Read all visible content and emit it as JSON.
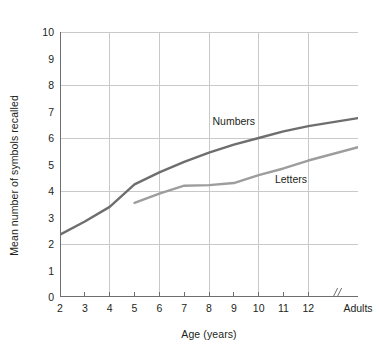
{
  "chart_data": {
    "type": "line",
    "title": "",
    "xlabel": "Age (years)",
    "ylabel": "Mean number of symbols recalled",
    "xlim": [
      2,
      14
    ],
    "ylim": [
      0,
      10
    ],
    "x_tick_labels": [
      "2",
      "3",
      "4",
      "5",
      "6",
      "7",
      "8",
      "9",
      "10",
      "11",
      "12",
      "Adults"
    ],
    "x_tick_values": [
      2,
      3,
      4,
      5,
      6,
      7,
      8,
      9,
      10,
      11,
      12,
      14
    ],
    "y_tick_labels": [
      "0",
      "1",
      "2",
      "3",
      "4",
      "5",
      "6",
      "7",
      "8",
      "9",
      "10"
    ],
    "y_tick_values": [
      0,
      1,
      2,
      3,
      4,
      5,
      6,
      7,
      8,
      9,
      10
    ],
    "grid": true,
    "grid_x_values": [
      4,
      6,
      8,
      10,
      12,
      14
    ],
    "grid_y_values": [
      2,
      4,
      6,
      8,
      10
    ],
    "axis_break": {
      "label": "//",
      "x_value": 13.1
    },
    "legend_position": "inline-on-lines",
    "series": [
      {
        "name": "Numbers",
        "color": "#6e6e6e",
        "x": [
          2,
          3,
          4,
          5,
          6,
          7,
          8,
          9,
          10,
          11,
          12,
          14
        ],
        "values": [
          2.35,
          2.85,
          3.4,
          4.25,
          4.7,
          5.1,
          5.45,
          5.75,
          6.0,
          6.25,
          6.45,
          6.75
        ],
        "label_x_value": 9.0,
        "label_y_value": 6.65
      },
      {
        "name": "Letters",
        "color": "#9d9d9d",
        "x": [
          5,
          6,
          7,
          8,
          9,
          10,
          11,
          12,
          14
        ],
        "values": [
          3.55,
          3.9,
          4.2,
          4.22,
          4.3,
          4.6,
          4.85,
          5.15,
          5.65
        ],
        "label_x_value": 11.3,
        "label_y_value": 4.45
      }
    ]
  },
  "colors": {
    "axis": "#6d6e71",
    "grid": "#c8c9cb",
    "text": "#231f20",
    "numbers_line": "#6e6e6e",
    "letters_line": "#9d9d9d",
    "background": "#ffffff"
  }
}
